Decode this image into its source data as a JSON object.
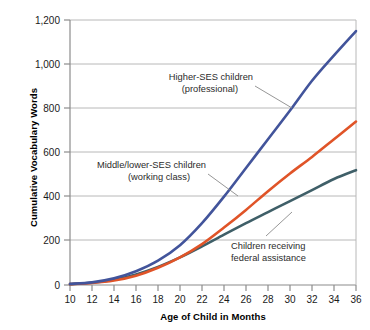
{
  "chart_data": {
    "type": "line",
    "title": "",
    "xlabel": "Age of Child in Months",
    "ylabel": "Cumulative Vocabulary Words",
    "xlim": [
      10,
      36
    ],
    "ylim": [
      0,
      1200
    ],
    "x_ticks": [
      "10",
      "12",
      "14",
      "16",
      "18",
      "20",
      "22",
      "24",
      "26",
      "28",
      "30",
      "32",
      "34",
      "36"
    ],
    "y_ticks": [
      "0",
      "200",
      "400",
      "600",
      "800",
      "1,000",
      "1,200"
    ],
    "grid": "horizontal",
    "legend_position": "inline-annotations",
    "x": [
      10,
      12,
      14,
      16,
      18,
      20,
      22,
      24,
      26,
      28,
      30,
      32,
      34,
      36
    ],
    "series": [
      {
        "name": "Higher-SES children (professional)",
        "color": "#42549b",
        "values": [
          5,
          12,
          30,
          62,
          110,
          180,
          280,
          400,
          530,
          660,
          790,
          925,
          1040,
          1150
        ]
      },
      {
        "name": "Middle/lower-SES children (working class)",
        "color": "#e05428",
        "values": [
          4,
          9,
          20,
          42,
          78,
          125,
          185,
          260,
          340,
          425,
          505,
          580,
          660,
          740
        ]
      },
      {
        "name": "Children receiving federal assistance",
        "color": "#3f5f68",
        "values": [
          4,
          10,
          24,
          48,
          82,
          125,
          175,
          228,
          280,
          330,
          380,
          430,
          480,
          520
        ]
      }
    ],
    "annotations": [
      {
        "id": "higher-ses",
        "line1": "Higher-SES children",
        "line2": "(professional)",
        "target_series": "Higher-SES children (professional)"
      },
      {
        "id": "middle-lower-ses",
        "line1": "Middle/lower-SES children",
        "line2": "(working class)",
        "target_series": "Middle/lower-SES children (working class)"
      },
      {
        "id": "federal-assistance",
        "line1": "Children receiving",
        "line2": "federal assistance",
        "target_series": "Children receiving federal assistance"
      }
    ]
  },
  "colors": {
    "grid": "#b8b8b8",
    "axis": "#8c8c8c",
    "leader": "#8a8a8a",
    "background": "#ffffff"
  }
}
